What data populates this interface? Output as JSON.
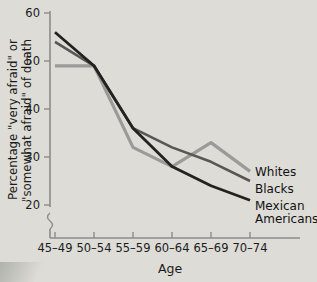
{
  "chart_data": {
    "type": "line",
    "title": "",
    "xlabel": "Age",
    "ylabel": "Percentage \"very afraid\" or \"somewhat afraid\" of death",
    "ylabel_line1": "Percentage \"very afraid\" or",
    "ylabel_line2": "\"somewhat afraid\" of death",
    "categories": [
      "45–49",
      "50–54",
      "55–59",
      "60–64",
      "65–69",
      "70–74"
    ],
    "ylim": [
      18,
      60
    ],
    "yticks": [
      20,
      30,
      40,
      50,
      60
    ],
    "ytick_labels": [
      "20",
      "30",
      "40",
      "50",
      "60"
    ],
    "grid": false,
    "axis_break": true,
    "legend_position": "right-inline",
    "series": [
      {
        "name": "Whites",
        "color": "#9a9a96",
        "values": [
          49,
          49,
          32,
          28,
          33,
          27
        ],
        "label": "Whites"
      },
      {
        "name": "Blacks",
        "color": "#575754",
        "values": [
          54,
          49,
          36,
          32,
          29,
          25
        ],
        "label": "Blacks"
      },
      {
        "name": "Mexican Americans",
        "color": "#222220",
        "values": [
          56,
          49,
          36,
          28,
          24,
          21
        ],
        "label_line1": "Mexican",
        "label_line2": "Americans",
        "label": "Mexican Americans"
      }
    ]
  },
  "axis": {
    "x_title": "Age",
    "axis_color": "#8c8c88"
  },
  "colors": {
    "background": "#dddcd7",
    "text": "#1b1b1b",
    "whites": "#9a9a96",
    "blacks": "#575754",
    "mexican_americans": "#222220"
  }
}
